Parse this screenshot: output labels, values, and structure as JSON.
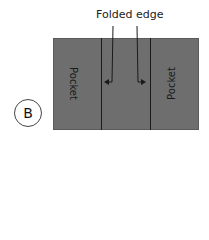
{
  "diagram": {
    "title": "Folded edge",
    "label": "B",
    "pockets": [
      {
        "label": "Pocket",
        "position": "left",
        "rotation": 90
      },
      {
        "label": "Pocket",
        "position": "right",
        "rotation": -90
      }
    ],
    "colors": {
      "panel": "#6e6e6e",
      "lines": "#1a1a1a",
      "text": "#222222"
    }
  }
}
